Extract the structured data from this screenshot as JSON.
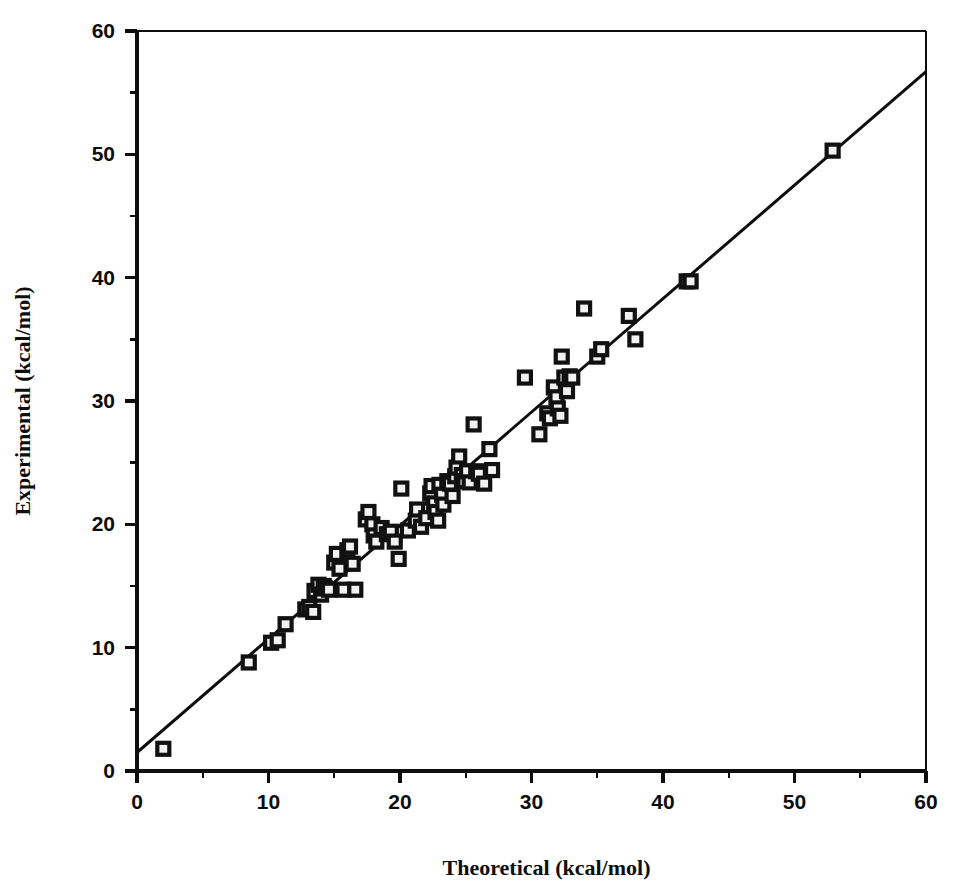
{
  "figure": {
    "background_color": "#ffffff",
    "ink_color": "#0d0d0d",
    "marker_fill": "#f2f2f2",
    "marker_edge": "#111111"
  },
  "chart_data": {
    "type": "scatter",
    "title": "",
    "subtitle": "",
    "xlabel": "Theoretical (kcal/mol)",
    "ylabel": "Experimental (kcal/mol)",
    "xlim": [
      0,
      60
    ],
    "ylim": [
      0,
      60
    ],
    "xticks": [
      0,
      10,
      20,
      30,
      40,
      50,
      60
    ],
    "yticks": [
      0,
      10,
      20,
      30,
      40,
      50,
      60
    ],
    "xticklabels": [
      "0",
      "10",
      "20",
      "30",
      "40",
      "50",
      "60"
    ],
    "yticklabels": [
      "0",
      "10",
      "20",
      "30",
      "40",
      "50",
      "60"
    ],
    "minor_tick_step": 5,
    "grid": false,
    "legend": null,
    "legend_position": "none",
    "marker_style": "open-square",
    "marker_size_px": 12,
    "annotations": [],
    "trendline": {
      "type": "line",
      "x": [
        0,
        60
      ],
      "y": [
        1.5,
        56.7
      ],
      "slope": 0.92,
      "intercept": 1.5,
      "linewidth_px": 3
    },
    "points": [
      {
        "x": 2.0,
        "y": 1.8
      },
      {
        "x": 8.5,
        "y": 8.8
      },
      {
        "x": 10.2,
        "y": 10.4
      },
      {
        "x": 10.7,
        "y": 10.6
      },
      {
        "x": 11.3,
        "y": 11.9
      },
      {
        "x": 12.8,
        "y": 13.1
      },
      {
        "x": 13.1,
        "y": 13.3
      },
      {
        "x": 13.4,
        "y": 12.9
      },
      {
        "x": 13.5,
        "y": 14.6
      },
      {
        "x": 13.8,
        "y": 15.1
      },
      {
        "x": 14.0,
        "y": 14.3
      },
      {
        "x": 14.2,
        "y": 15.0
      },
      {
        "x": 14.3,
        "y": 14.8
      },
      {
        "x": 14.6,
        "y": 14.7
      },
      {
        "x": 15.0,
        "y": 16.9
      },
      {
        "x": 15.2,
        "y": 17.6
      },
      {
        "x": 15.4,
        "y": 16.4
      },
      {
        "x": 15.7,
        "y": 14.7
      },
      {
        "x": 16.0,
        "y": 17.9
      },
      {
        "x": 16.2,
        "y": 18.2
      },
      {
        "x": 16.4,
        "y": 16.8
      },
      {
        "x": 16.6,
        "y": 14.7
      },
      {
        "x": 17.4,
        "y": 20.4
      },
      {
        "x": 17.6,
        "y": 21.0
      },
      {
        "x": 17.9,
        "y": 20.0
      },
      {
        "x": 18.0,
        "y": 19.1
      },
      {
        "x": 18.2,
        "y": 18.6
      },
      {
        "x": 18.6,
        "y": 19.7
      },
      {
        "x": 19.0,
        "y": 19.2
      },
      {
        "x": 19.3,
        "y": 19.4
      },
      {
        "x": 19.6,
        "y": 18.6
      },
      {
        "x": 19.9,
        "y": 17.2
      },
      {
        "x": 20.1,
        "y": 22.9
      },
      {
        "x": 20.6,
        "y": 19.5
      },
      {
        "x": 21.2,
        "y": 20.3
      },
      {
        "x": 21.3,
        "y": 21.2
      },
      {
        "x": 21.6,
        "y": 19.8
      },
      {
        "x": 22.0,
        "y": 20.5
      },
      {
        "x": 22.3,
        "y": 22.5
      },
      {
        "x": 22.4,
        "y": 23.1
      },
      {
        "x": 22.6,
        "y": 21.7
      },
      {
        "x": 22.7,
        "y": 21.0
      },
      {
        "x": 22.9,
        "y": 20.3
      },
      {
        "x": 23.0,
        "y": 23.2
      },
      {
        "x": 23.2,
        "y": 22.4
      },
      {
        "x": 23.3,
        "y": 21.6
      },
      {
        "x": 23.6,
        "y": 23.5
      },
      {
        "x": 23.8,
        "y": 23.3
      },
      {
        "x": 24.0,
        "y": 22.3
      },
      {
        "x": 24.2,
        "y": 23.9
      },
      {
        "x": 24.3,
        "y": 24.6
      },
      {
        "x": 24.5,
        "y": 25.5
      },
      {
        "x": 24.7,
        "y": 24.0
      },
      {
        "x": 24.9,
        "y": 23.5
      },
      {
        "x": 25.1,
        "y": 24.3
      },
      {
        "x": 25.3,
        "y": 23.4
      },
      {
        "x": 25.6,
        "y": 28.1
      },
      {
        "x": 25.8,
        "y": 24.3
      },
      {
        "x": 26.0,
        "y": 24.1
      },
      {
        "x": 26.4,
        "y": 23.3
      },
      {
        "x": 26.8,
        "y": 26.1
      },
      {
        "x": 27.0,
        "y": 24.4
      },
      {
        "x": 29.5,
        "y": 31.9
      },
      {
        "x": 30.6,
        "y": 27.3
      },
      {
        "x": 31.2,
        "y": 29.0
      },
      {
        "x": 31.4,
        "y": 28.6
      },
      {
        "x": 31.7,
        "y": 31.1
      },
      {
        "x": 31.9,
        "y": 30.3
      },
      {
        "x": 32.0,
        "y": 29.4
      },
      {
        "x": 32.2,
        "y": 28.8
      },
      {
        "x": 32.3,
        "y": 33.6
      },
      {
        "x": 32.5,
        "y": 31.9
      },
      {
        "x": 32.7,
        "y": 30.8
      },
      {
        "x": 32.9,
        "y": 32.0
      },
      {
        "x": 33.1,
        "y": 31.9
      },
      {
        "x": 34.0,
        "y": 37.5
      },
      {
        "x": 35.0,
        "y": 33.6
      },
      {
        "x": 35.3,
        "y": 34.2
      },
      {
        "x": 37.4,
        "y": 36.9
      },
      {
        "x": 37.9,
        "y": 35.0
      },
      {
        "x": 41.8,
        "y": 39.7
      },
      {
        "x": 42.1,
        "y": 39.7
      },
      {
        "x": 52.9,
        "y": 50.3
      }
    ]
  }
}
